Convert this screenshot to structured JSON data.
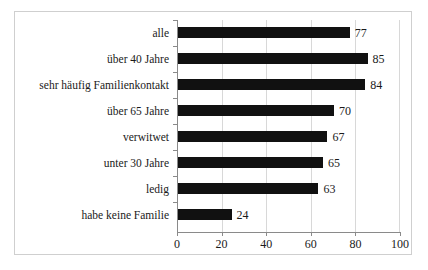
{
  "chart_data": {
    "type": "bar",
    "orientation": "horizontal",
    "title": "",
    "subtitle": "",
    "xlabel": "",
    "ylabel": "",
    "xlim": [
      0,
      100
    ],
    "xticks": [
      0,
      20,
      40,
      60,
      80,
      100
    ],
    "xtick_labels": [
      "0",
      "20",
      "40",
      "60",
      "80",
      "100"
    ],
    "grid": "vertical",
    "legend": "none",
    "bar_color": "#111111",
    "categories": [
      "alle",
      "über 40 Jahre",
      "sehr häufig Familienkontakt",
      "über 65 Jahre",
      "verwitwet",
      "unter 30 Jahre",
      "ledig",
      "habe keine Familie"
    ],
    "values": [
      77,
      85,
      84,
      70,
      67,
      65,
      63,
      24
    ],
    "value_labels": [
      "77",
      "85",
      "84",
      "70",
      "67",
      "65",
      "63",
      "24"
    ]
  }
}
